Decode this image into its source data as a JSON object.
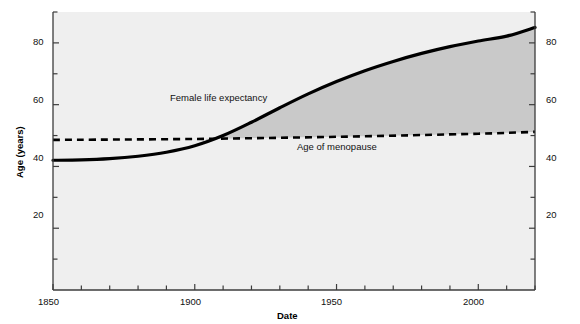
{
  "chart_data": {
    "type": "line",
    "title": "",
    "xlabel": "Date",
    "ylabel": "Age (years)",
    "xlim": [
      1850,
      2020
    ],
    "ylim": [
      0,
      90
    ],
    "grid": false,
    "legend_position": "inline-annotations",
    "x_ticks_major": [
      1850,
      1900,
      1950,
      2000
    ],
    "x_tick_labels": [
      "1850",
      "1900",
      "1950",
      "2000"
    ],
    "x_ticks_minor_step": 10,
    "y_ticks_major": [
      20,
      40,
      60,
      80
    ],
    "y_tick_labels": [
      "20",
      "40",
      "60",
      "80"
    ],
    "y_ticks_minor_step": 10,
    "right_axis_mirrored": true,
    "right_y_tick_labels": [
      "20",
      "40",
      "60",
      "80"
    ],
    "series": [
      {
        "name": "Female life expectancy",
        "style": "solid",
        "color": "#000000",
        "x": [
          1850,
          1860,
          1870,
          1880,
          1890,
          1900,
          1910,
          1920,
          1930,
          1940,
          1950,
          1960,
          1970,
          1980,
          1990,
          2000,
          2010,
          2020
        ],
        "values": [
          42.0,
          42.1,
          42.5,
          43.3,
          44.6,
          46.7,
          50.0,
          54.3,
          59.0,
          63.5,
          67.5,
          71.0,
          74.0,
          76.6,
          78.8,
          80.6,
          82.2,
          85.0
        ]
      },
      {
        "name": "Age of menopause",
        "style": "dashed",
        "color": "#000000",
        "x": [
          1850,
          1900,
          1950,
          2000,
          2020
        ],
        "values": [
          48.6,
          48.9,
          49.6,
          50.6,
          51.2
        ]
      }
    ],
    "shaded_region": {
      "label": "Years lived after menopause",
      "fill": "#c9c9c9",
      "between": [
        "Female life expectancy",
        "Age of menopause"
      ],
      "x_start": 1904,
      "x_end": 2020
    },
    "annotations": [
      {
        "text": "Female life expectancy",
        "x": 1904,
        "y": 62
      },
      {
        "text": "Age of menopause",
        "x": 1972,
        "y": 44
      }
    ],
    "crossover_point": {
      "x": 1904,
      "y": 49
    }
  },
  "axis": {
    "y_title": "Age (years)",
    "x_title": "Date"
  },
  "plot": {
    "background": "#efefef",
    "axis_color": "#3c3c3c"
  }
}
